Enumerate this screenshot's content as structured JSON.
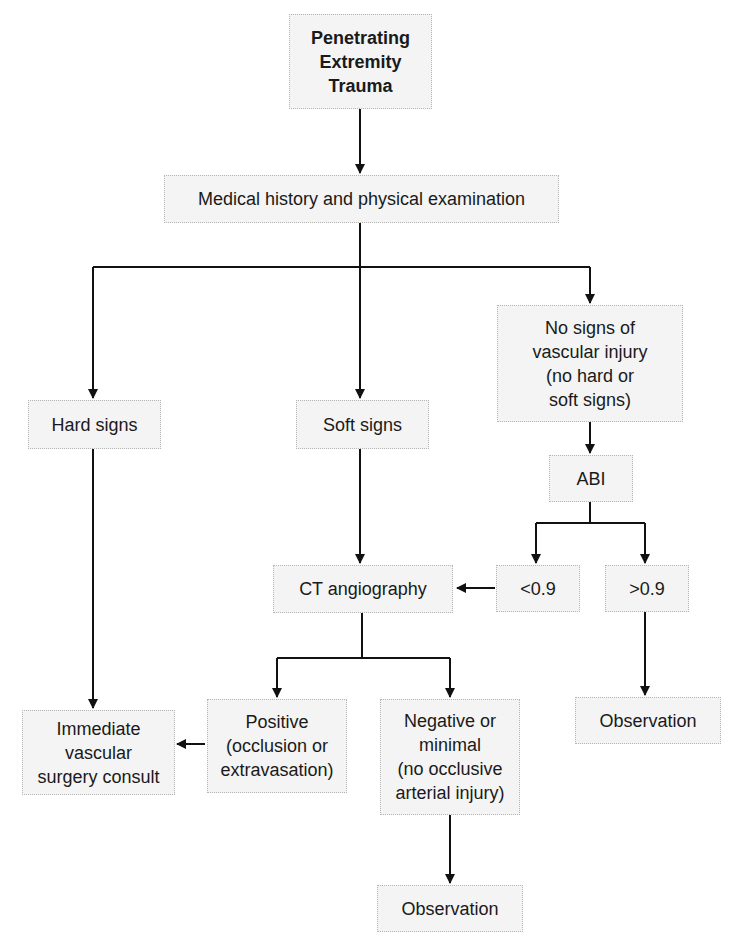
{
  "diagram": {
    "type": "flowchart",
    "title": "Penetrating Extremity Trauma",
    "colors": {
      "line": "#111111",
      "box_fill": "#f4f4f4",
      "box_border": "#b5b5b5",
      "text": "#1a1a1a"
    },
    "nodes": {
      "root": {
        "lines": [
          "Penetrating",
          "Extremity",
          "Trauma"
        ]
      },
      "history": {
        "label": "Medical history and physical examination"
      },
      "hard": {
        "label": "Hard signs"
      },
      "soft": {
        "label": "Soft signs"
      },
      "nosigns": {
        "lines": [
          "No signs of",
          "vascular injury",
          "(no hard or",
          "soft signs)"
        ]
      },
      "abi": {
        "label": "ABI"
      },
      "lt": {
        "label": "<0.9"
      },
      "gt": {
        "label": ">0.9"
      },
      "cta": {
        "label": "CT angiography"
      },
      "obs_right": {
        "label": "Observation"
      },
      "consult": {
        "lines": [
          "Immediate",
          "vascular",
          "surgery consult"
        ]
      },
      "positive": {
        "lines": [
          "Positive",
          "(occlusion or",
          "extravasation)"
        ]
      },
      "negative": {
        "lines": [
          "Negative or",
          "minimal",
          "(no occlusive",
          "arterial injury)"
        ]
      },
      "obs_bottom": {
        "label": "Observation"
      }
    },
    "edges": [
      [
        "root",
        "history"
      ],
      [
        "history",
        "hard"
      ],
      [
        "history",
        "soft"
      ],
      [
        "history",
        "nosigns"
      ],
      [
        "nosigns",
        "abi"
      ],
      [
        "abi",
        "lt"
      ],
      [
        "abi",
        "gt"
      ],
      [
        "lt",
        "cta"
      ],
      [
        "soft",
        "cta"
      ],
      [
        "gt",
        "obs_right"
      ],
      [
        "hard",
        "consult"
      ],
      [
        "cta",
        "positive"
      ],
      [
        "cta",
        "negative"
      ],
      [
        "positive",
        "consult"
      ],
      [
        "negative",
        "obs_bottom"
      ]
    ]
  }
}
